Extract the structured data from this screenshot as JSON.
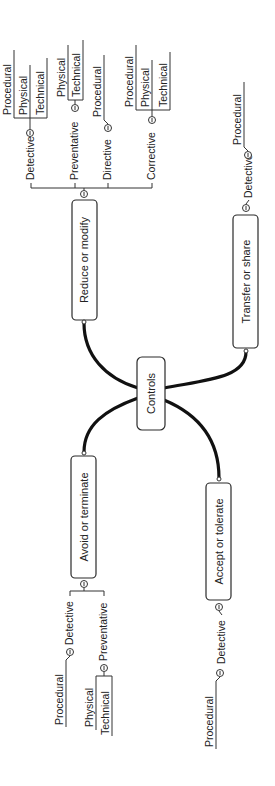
{
  "diagram": {
    "type": "mind-map",
    "orientation": "rotated -90deg",
    "root": {
      "label": "Controls"
    },
    "branches": [
      {
        "label": "Reduce or modify",
        "children": [
          {
            "label": "Detective",
            "children": [
              "Procedural",
              "Physical",
              "Technical"
            ]
          },
          {
            "label": "Preventative",
            "children": [
              "Physical",
              "Technical"
            ]
          },
          {
            "label": "Directive",
            "children": [
              "Procedural"
            ]
          },
          {
            "label": "Corrective",
            "children": [
              "Procedural",
              "Physical",
              "Technical"
            ]
          }
        ]
      },
      {
        "label": "Transfer or share",
        "children": [
          {
            "label": "Detective",
            "children": [
              "Procedural"
            ]
          }
        ]
      },
      {
        "label": "Avoid or terminate",
        "children": [
          {
            "label": "Detective",
            "children": [
              "Procedural"
            ]
          },
          {
            "label": "Preventative",
            "children": [
              "Physical",
              "Technical"
            ]
          }
        ]
      },
      {
        "label": "Accept or tolerate",
        "children": [
          {
            "label": "Detective",
            "children": [
              "Procedural"
            ]
          }
        ]
      }
    ]
  },
  "labels": {
    "root": "Controls",
    "reduce": "Reduce or modify",
    "transfer": "Transfer or share",
    "avoid": "Avoid or terminate",
    "accept": "Accept or tolerate",
    "r_detective": "Detective",
    "r_detective_procedural": "Procedural",
    "r_detective_physical": "Physical",
    "r_detective_technical": "Technical",
    "r_preventative": "Preventative",
    "r_preventative_physical": "Physical",
    "r_preventative_technical": "Technical",
    "r_directive": "Directive",
    "r_directive_procedural": "Procedural",
    "r_corrective": "Corrective",
    "r_corrective_procedural": "Procedural",
    "r_corrective_physical": "Physical",
    "r_corrective_technical": "Technical",
    "t_detective": "Detective",
    "t_detective_procedural": "Procedural",
    "a_detective": "Detective",
    "a_detective_procedural": "Procedural",
    "a_preventative": "Preventative",
    "a_preventative_physical": "Physical",
    "a_preventative_technical": "Technical",
    "c_detective": "Detective",
    "c_detective_procedural": "Procedural"
  },
  "colors": {
    "background": "#ffffff",
    "stroke": "#111111",
    "text": "#222222"
  }
}
